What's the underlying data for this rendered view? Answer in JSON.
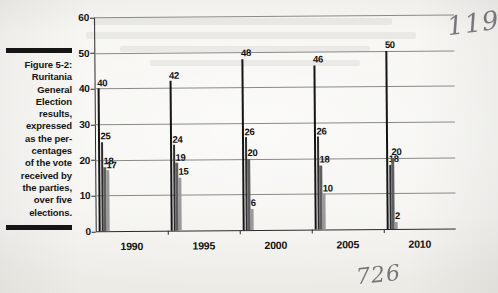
{
  "caption": {
    "figure_label": "Figure 5-2:",
    "text": "Ruritania General Election results, expressed as the per-centages of the vote received by the parties, over five elections.",
    "lines": [
      "Ruritania",
      "General",
      "Election",
      "results,",
      "expressed",
      "as the per-",
      "centages",
      "of the vote",
      "received by",
      "the parties,",
      "over five",
      "elections."
    ]
  },
  "annotations": {
    "page_number_handwritten": "119",
    "note_handwritten": "726"
  },
  "colors": {
    "series1": "#151515",
    "series2": "#2f2f2f",
    "series3": "#5e5e5e",
    "series4": "#9a9a9a",
    "gridline": "#8a8a88",
    "axis": "#2a2a2a",
    "paper": "#f3f2ee"
  },
  "chart_data": {
    "type": "bar",
    "title": "",
    "xlabel": "",
    "ylabel": "",
    "categories": [
      "1990",
      "1995",
      "2000",
      "2005",
      "2010"
    ],
    "yticks": [
      0,
      10,
      20,
      30,
      40,
      50,
      60
    ],
    "ylim": [
      0,
      60
    ],
    "grid": true,
    "legend": "none",
    "series": [
      {
        "name": "Party 1",
        "values": [
          40,
          42,
          48,
          46,
          50
        ]
      },
      {
        "name": "Party 2",
        "values": [
          25,
          24,
          26,
          26,
          18
        ]
      },
      {
        "name": "Party 3",
        "values": [
          18,
          19,
          20,
          18,
          20
        ]
      },
      {
        "name": "Party 4",
        "values": [
          17,
          15,
          6,
          10,
          2
        ]
      }
    ]
  }
}
